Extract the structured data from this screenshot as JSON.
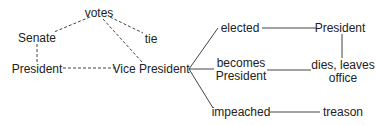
{
  "diagram": {
    "type": "concept-map",
    "nodes": [
      {
        "id": "votes",
        "label": "votes",
        "x": 99,
        "y": 13
      },
      {
        "id": "senate",
        "label": "Senate",
        "x": 37,
        "y": 38
      },
      {
        "id": "tie",
        "label": "tie",
        "x": 151,
        "y": 39
      },
      {
        "id": "president_left",
        "label": "President",
        "x": 37,
        "y": 69
      },
      {
        "id": "vice_president",
        "label": "Vice President",
        "x": 151,
        "y": 69
      },
      {
        "id": "elected",
        "label": "elected",
        "x": 224,
        "y": 28
      },
      {
        "id": "president_right",
        "label": "President",
        "x": 340,
        "y": 28
      },
      {
        "id": "becomes_president",
        "label": "becomes\nPresident",
        "x": 225,
        "y": 70
      },
      {
        "id": "dies_leaves_office",
        "label": "dies, leaves\noffice",
        "x": 343,
        "y": 72
      },
      {
        "id": "impeached",
        "label": "impeached",
        "x": 224,
        "y": 112
      },
      {
        "id": "treason",
        "label": "treason",
        "x": 343,
        "y": 112
      }
    ],
    "edges": [
      {
        "from": "votes",
        "to": "senate",
        "style": "dashed"
      },
      {
        "from": "votes",
        "to": "tie",
        "style": "dashed"
      },
      {
        "from": "votes",
        "to": "vice_president",
        "style": "dashed"
      },
      {
        "from": "senate",
        "to": "president_left",
        "style": "dashed"
      },
      {
        "from": "president_left",
        "to": "vice_president",
        "style": "dashed"
      },
      {
        "from": "vice_president",
        "to": "elected",
        "style": "solid"
      },
      {
        "from": "vice_president",
        "to": "becomes_president",
        "style": "solid"
      },
      {
        "from": "vice_president",
        "to": "impeached",
        "style": "solid"
      },
      {
        "from": "elected",
        "to": "president_right",
        "style": "solid"
      },
      {
        "from": "president_right",
        "to": "dies_leaves_office",
        "style": "solid"
      },
      {
        "from": "becomes_president",
        "to": "dies_leaves_office",
        "style": "solid"
      },
      {
        "from": "impeached",
        "to": "treason",
        "style": "solid"
      }
    ]
  },
  "labels": {
    "votes": "votes",
    "senate": "Senate",
    "tie": "tie",
    "president_left": "President",
    "vice_president": "Vice President",
    "elected": "elected",
    "president_right": "President",
    "becomes_1": "becomes",
    "becomes_2": "President",
    "dies_1": "dies, leaves",
    "dies_2": "office",
    "impeached": "impeached",
    "treason": "treason"
  }
}
